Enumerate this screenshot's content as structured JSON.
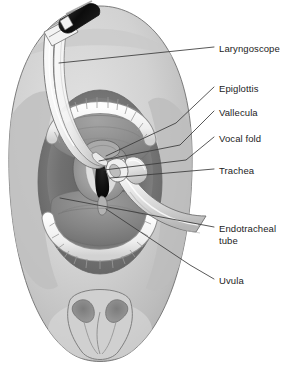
{
  "figure": {
    "type": "medical-anatomical-illustration",
    "background_color": "#ffffff",
    "line_color": "#3a3a3a",
    "text_color": "#1c1c1c"
  },
  "labels": [
    {
      "id": "laryngoscope",
      "text": "Laryngoscope",
      "text_x": 219,
      "text_y": 50,
      "leader": {
        "x1": 59,
        "y1": 63,
        "x2": 214,
        "y2": 47
      }
    },
    {
      "id": "epiglottis",
      "text": "Epiglottis",
      "text_x": 219,
      "text_y": 90,
      "leader_path": "M 106 156 L 176 123 L 214 87"
    },
    {
      "id": "vallecula",
      "text": "Vallecula",
      "text_x": 219,
      "text_y": 114,
      "leader_path": "M 99 161 L 180 145 L 214 111"
    },
    {
      "id": "vocal-fold",
      "text": "Vocal fold",
      "text_x": 219,
      "text_y": 140,
      "leader_path": "M 104 170 L 186 160 L 214 137"
    },
    {
      "id": "trachea",
      "text": "Trachea",
      "text_x": 219,
      "text_y": 172,
      "leader": {
        "x1": 110,
        "y1": 178,
        "x2": 214,
        "y2": 169
      }
    },
    {
      "id": "endotracheal-tube",
      "text": "Endotracheal",
      "text2": "tube",
      "text_x": 219,
      "text_y": 230,
      "text2_y": 244,
      "leader": {
        "x1": 60,
        "y1": 198,
        "x2": 214,
        "y2": 227
      }
    },
    {
      "id": "uvula",
      "text": "Uvula",
      "text_x": 219,
      "text_y": 282,
      "leader_path": "M 106 209 L 190 265 L 214 279"
    }
  ],
  "anatomy": {
    "head_outline": "oval face seen from above, patient supine",
    "parts": [
      "laryngoscope handle",
      "laryngoscope blade",
      "upper teeth arch",
      "lower teeth arch",
      "tongue",
      "pharynx",
      "epiglottis",
      "vallecula",
      "vocal folds",
      "glottic opening / trachea",
      "endotracheal tube",
      "endotracheal tube cuff",
      "uvula",
      "nostrils",
      "nose"
    ]
  },
  "palette": {
    "skin_light": "#d6d6d6",
    "skin_mid": "#c2c2c2",
    "skin_shadow": "#a9a9a9",
    "mucosa_light": "#9a9a9a",
    "mucosa_mid": "#838383",
    "mucosa_dark": "#6d6d6d",
    "cavity_dark": "#545454",
    "glottis_black": "#0d0d0d",
    "tooth_white": "#f4f4f4",
    "tooth_edge": "#9e9e9e",
    "device_white": "#f7f7f7",
    "device_shade": "#d0d0d0",
    "handle_black": "#141414",
    "outline": "#3a3a3a"
  }
}
